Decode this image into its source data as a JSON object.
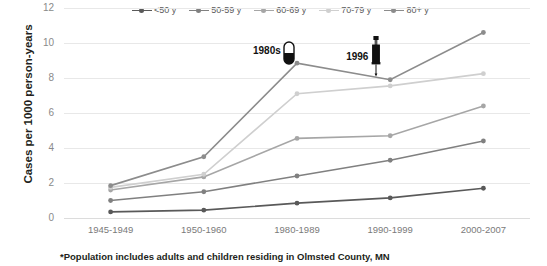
{
  "chart_data": {
    "type": "line",
    "title": "",
    "xlabel": "",
    "ylabel": "Cases per 1000 person-years",
    "ylim": [
      0,
      12
    ],
    "yticks": [
      0,
      2,
      4,
      6,
      8,
      10,
      12
    ],
    "grid": true,
    "legend_position": "top",
    "categories": [
      "1945-1949",
      "1950-1960",
      "1980-1989",
      "1990-1999",
      "2000-2007"
    ],
    "series": [
      {
        "name": "<50 y",
        "color": "#595959",
        "values": [
          0.35,
          0.45,
          0.85,
          1.15,
          1.7
        ]
      },
      {
        "name": "50-59 y",
        "color": "#808080",
        "values": [
          1.0,
          1.5,
          2.4,
          3.3,
          4.4
        ]
      },
      {
        "name": "60-69 y",
        "color": "#a6a6a6",
        "values": [
          1.6,
          2.35,
          4.55,
          4.7,
          6.4
        ]
      },
      {
        "name": "70-79 y",
        "color": "#cfcfcf",
        "values": [
          1.75,
          2.5,
          7.1,
          7.55,
          8.25
        ]
      },
      {
        "name": "80+ y",
        "color": "#8c8c8c",
        "values": [
          1.85,
          3.5,
          8.85,
          7.9,
          10.6
        ]
      }
    ],
    "annotations": [
      {
        "label": "1980s",
        "icon": "pill-icon",
        "category": "1980-1989",
        "value": 10.0
      },
      {
        "label": "1996",
        "icon": "syringe-icon",
        "category": "1990-1999",
        "value": 10.0
      }
    ]
  },
  "footnote": "*Population includes adults and children residing in Olmsted County, MN",
  "colors": {
    "gridline": "#e8e8e8",
    "tick_text": "#7a7a7a",
    "axis_title": "#231f20"
  }
}
